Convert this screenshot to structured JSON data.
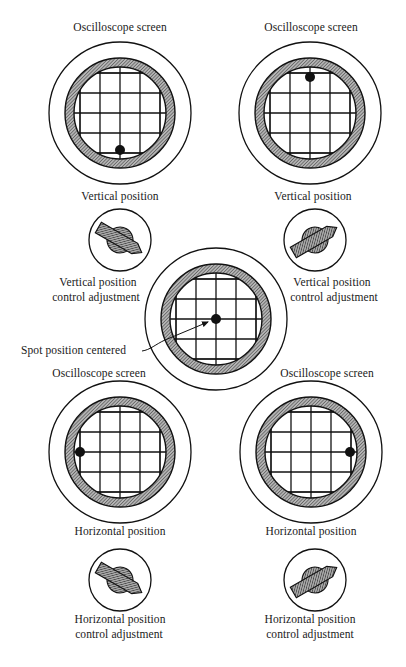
{
  "figure": {
    "type": "oscilloscope position control diagram",
    "colors": {
      "line": "#111111",
      "hatch_fill": "#8a8a8a",
      "background": "#ffffff",
      "spot": "#111111"
    }
  },
  "screens": [
    {
      "id": "top-left",
      "title": "Oscilloscope screen",
      "caption": "Vertical position",
      "center": [
        120,
        113
      ],
      "spot": [
        120,
        150
      ],
      "spot_description": "spot moved down"
    },
    {
      "id": "top-right",
      "title": "Oscilloscope screen",
      "caption": "Vertical position",
      "center": [
        310,
        113
      ],
      "spot": [
        310,
        77
      ],
      "spot_description": "spot moved up"
    },
    {
      "id": "center",
      "title": "",
      "caption": "",
      "center": [
        216,
        319
      ],
      "spot": [
        216,
        319
      ],
      "spot_description": "spot centered"
    },
    {
      "id": "bottom-left",
      "title": "Oscilloscope screen",
      "caption": "Horizontal position",
      "center": [
        120,
        452
      ],
      "spot": [
        80,
        452
      ],
      "spot_description": "spot moved left"
    },
    {
      "id": "bottom-right",
      "title": "Oscilloscope screen",
      "caption": "Horizontal position",
      "center": [
        311,
        452
      ],
      "spot": [
        350,
        452
      ],
      "spot_description": "spot moved right"
    }
  ],
  "knobs": [
    {
      "id": "vertical-left",
      "center": [
        120,
        240
      ],
      "rotation": 30,
      "label_line1": "Vertical position",
      "label_line2": "control adjustment"
    },
    {
      "id": "vertical-right",
      "center": [
        315,
        240
      ],
      "rotation": -30,
      "label_line1": "Vertical position",
      "label_line2": "control adjustment"
    },
    {
      "id": "horizontal-left",
      "center": [
        120,
        580
      ],
      "rotation": 30,
      "label_line1": "Horizontal position",
      "label_line2": "control adjustment"
    },
    {
      "id": "horizontal-right",
      "center": [
        315,
        580
      ],
      "rotation": -30,
      "label_line1": "Horizontal position",
      "label_line2": "control adjustment"
    }
  ],
  "labels": {
    "top_left_title": "Oscilloscope screen",
    "top_right_title": "Oscilloscope screen",
    "top_left_caption": "Vertical position",
    "top_right_caption": "Vertical position",
    "knob_tl_line1": "Vertical position",
    "knob_tl_line2": "control adjustment",
    "knob_tr_line1": "Vertical position",
    "knob_tr_line2": "control adjustment",
    "center_callout": "Spot position centered",
    "bottom_left_title": "Oscilloscope screen",
    "bottom_right_title": "Oscilloscope screen",
    "bottom_left_caption": "Horizontal position",
    "bottom_right_caption": "Horizontal position",
    "knob_bl_line1": "Horizontal position",
    "knob_bl_line2": "control adjustment",
    "knob_br_line1": "Horizontal position",
    "knob_br_line2": "control adjustment"
  }
}
